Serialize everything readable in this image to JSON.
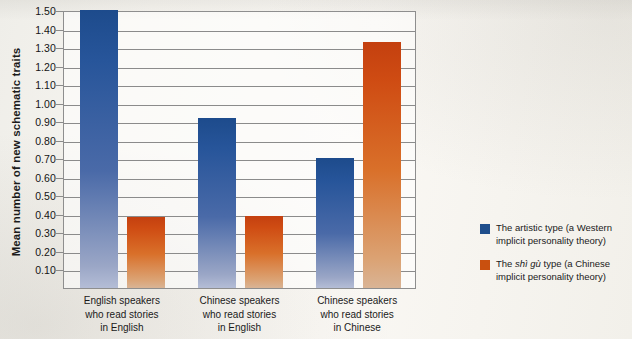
{
  "chart_data": {
    "type": "bar",
    "title": "",
    "xlabel": "",
    "ylabel": "Mean number of new schematic traits",
    "ylim": [
      0.0,
      1.5
    ],
    "ytick_step": 0.1,
    "ytick_labels": [
      "1.50",
      "1.40",
      "1.30",
      "1.20",
      "1.10",
      "1.00",
      "0.90",
      "0.80",
      "0.70",
      "0.60",
      "0.50",
      "0.40",
      "0.30",
      "0.20",
      "0.10"
    ],
    "grid": true,
    "legend_position": "right",
    "categories": [
      [
        "English speakers",
        "who read stories",
        "in English"
      ],
      [
        "Chinese speakers",
        "who read stories",
        "in English"
      ],
      [
        "Chinese speakers",
        "who read stories",
        "in Chinese"
      ]
    ],
    "series": [
      {
        "name": "The artistic type (a Western implicit personality theory)",
        "color": "#1f4e8c",
        "values": [
          1.5,
          0.92,
          0.7
        ]
      },
      {
        "name": "The shì gù type (a Chinese implicit personality theory)",
        "color": "#c9500f",
        "values": [
          0.385,
          0.39,
          1.33
        ]
      }
    ]
  },
  "legend": {
    "items": [
      {
        "color": "#1f4e8c",
        "prefix": "The artistic type (a Western implicit ",
        "italic": "",
        "suffix": "personality theory)"
      },
      {
        "color": "#c9500f",
        "prefix": "The ",
        "italic": "shì gù",
        "suffix": " type (a Chinese implicit personality theory)"
      }
    ]
  }
}
